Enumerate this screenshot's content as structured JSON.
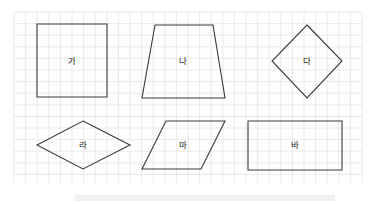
{
  "grid": {
    "x": 14,
    "y": 12,
    "width": 348,
    "height": 171,
    "cell": 11.6,
    "line_color": "#e4e4e4"
  },
  "shapes": [
    {
      "id": "ga",
      "label": "가",
      "kind": "square",
      "points": "37,24 107,24 107,97 37,97",
      "label_pos": [
        72,
        61
      ]
    },
    {
      "id": "na",
      "label": "나",
      "kind": "trapezoid",
      "points": "155,25 213,25 225,98 142,98",
      "label_pos": [
        183,
        61
      ]
    },
    {
      "id": "da",
      "label": "다",
      "kind": "rhombus",
      "points": "307,25 342,61 307,98 272,61",
      "label_pos": [
        307,
        61
      ]
    },
    {
      "id": "ra",
      "label": "라",
      "kind": "rhombus",
      "points": "83,121 130,145 83,169 37,145",
      "label_pos": [
        83,
        145
      ]
    },
    {
      "id": "ma",
      "label": "마",
      "kind": "parallelogram",
      "points": "166,121 225,121 201,169 142,169",
      "label_pos": [
        183,
        145
      ]
    },
    {
      "id": "ba",
      "label": "바",
      "kind": "rectangle",
      "points": "248,121 342,121 342,170 248,170",
      "label_pos": [
        295,
        145
      ]
    }
  ]
}
